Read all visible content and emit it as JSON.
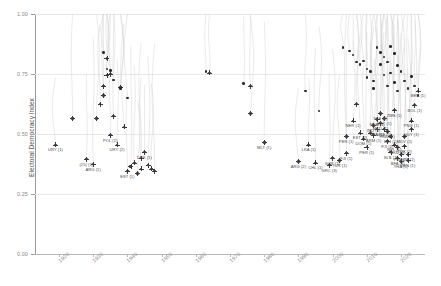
{
  "chart_data": {
    "type": "scatter",
    "title": "",
    "xlabel": "",
    "ylabel": "Electoral Democracy Index",
    "xlim": [
      1913,
      2027
    ],
    "ylim": [
      0.0,
      1.0
    ],
    "grid": true,
    "legend": "none",
    "xticks": [
      1920,
      1930,
      1940,
      1950,
      1960,
      1970,
      1980,
      1990,
      2000,
      2010,
      2020
    ],
    "yticks": [
      "0.00",
      "0.25",
      "0.50",
      "0.75",
      "1.00"
    ],
    "series": [
      {
        "name": "Democratic breakdown episodes",
        "marker": "plus-dot",
        "color": "#2b2b2b",
        "points": [
          {
            "x": 1919,
            "y": 0.455,
            "label": "URY (1)"
          },
          {
            "x": 1924,
            "y": 0.565,
            "label": ""
          },
          {
            "x": 1928,
            "y": 0.395,
            "label": "(25) (1)"
          },
          {
            "x": 1930,
            "y": 0.375,
            "label": "ARG (1)"
          },
          {
            "x": 1931,
            "y": 0.565,
            "label": ""
          },
          {
            "x": 1932,
            "y": 0.625,
            "label": ""
          },
          {
            "x": 1933,
            "y": 0.7,
            "label": ""
          },
          {
            "x": 1933,
            "y": 0.66,
            "label": ""
          },
          {
            "x": 1934,
            "y": 0.815,
            "label": ""
          },
          {
            "x": 1934,
            "y": 0.745,
            "label": ""
          },
          {
            "x": 1935,
            "y": 0.75,
            "label": ""
          },
          {
            "x": 1935,
            "y": 0.495,
            "label": "POL (1)"
          },
          {
            "x": 1936,
            "y": 0.575,
            "label": ""
          },
          {
            "x": 1937,
            "y": 0.455,
            "label": "URY (2)"
          },
          {
            "x": 1938,
            "y": 0.695,
            "label": ""
          },
          {
            "x": 1939,
            "y": 0.53,
            "label": ""
          },
          {
            "x": 1940,
            "y": 0.345,
            "label": "EST (1)"
          },
          {
            "x": 1941,
            "y": 0.365,
            "label": ""
          },
          {
            "x": 1942,
            "y": 0.38,
            "label": ""
          },
          {
            "x": 1943,
            "y": 0.335,
            "label": ""
          },
          {
            "x": 1944,
            "y": 0.4,
            "label": ""
          },
          {
            "x": 1944,
            "y": 0.355,
            "label": ""
          },
          {
            "x": 1945,
            "y": 0.425,
            "label": "DNK (1)"
          },
          {
            "x": 1946,
            "y": 0.37,
            "label": ""
          },
          {
            "x": 1947,
            "y": 0.355,
            "label": ""
          },
          {
            "x": 1948,
            "y": 0.345,
            "label": ""
          },
          {
            "x": 1964,
            "y": 0.755,
            "label": ""
          },
          {
            "x": 1976,
            "y": 0.7,
            "label": ""
          },
          {
            "x": 1980,
            "y": 0.465,
            "label": "MLT (1)"
          },
          {
            "x": 1976,
            "y": 0.585,
            "label": ""
          },
          {
            "x": 1990,
            "y": 0.385,
            "label": "ARG (2)"
          },
          {
            "x": 1995,
            "y": 0.38,
            "label": "CHL (1)"
          },
          {
            "x": 1999,
            "y": 0.37,
            "label": "GRC (3)"
          },
          {
            "x": 1993,
            "y": 0.455,
            "label": "LKA (1)"
          },
          {
            "x": 2000,
            "y": 0.4,
            "label": "SUR (1)"
          },
          {
            "x": 2002,
            "y": 0.39,
            "label": "TUR (1)"
          },
          {
            "x": 2004,
            "y": 0.49,
            "label": "PER (1)"
          },
          {
            "x": 2004,
            "y": 0.42,
            "label": "FJI (1)"
          },
          {
            "x": 2006,
            "y": 0.555,
            "label": "NER (1)"
          },
          {
            "x": 2007,
            "y": 0.625,
            "label": ""
          },
          {
            "x": 2008,
            "y": 0.505,
            "label": "EST (2)"
          },
          {
            "x": 2009,
            "y": 0.48,
            "label": "DOM (1)"
          },
          {
            "x": 2010,
            "y": 0.445,
            "label": "PER (1)"
          },
          {
            "x": 2011,
            "y": 0.505,
            "label": ""
          },
          {
            "x": 2012,
            "y": 0.535,
            "label": "IND (1)"
          },
          {
            "x": 2012,
            "y": 0.495,
            "label": "ARM (1)"
          },
          {
            "x": 2013,
            "y": 0.52,
            "label": "TZA (1)"
          },
          {
            "x": 2013,
            "y": 0.56,
            "label": "MDA (1)"
          },
          {
            "x": 2014,
            "y": 0.545,
            "label": "MKD (1)"
          },
          {
            "x": 2014,
            "y": 0.585,
            "label": "SLE (1)"
          },
          {
            "x": 2015,
            "y": 0.565,
            "label": "GUY (1)"
          },
          {
            "x": 2015,
            "y": 0.52,
            "label": "UKR (1)"
          },
          {
            "x": 2016,
            "y": 0.47,
            "label": "FJI (2)"
          },
          {
            "x": 2016,
            "y": 0.51,
            "label": "HND (1)"
          },
          {
            "x": 2017,
            "y": 0.425,
            "label": "SLB (1)"
          },
          {
            "x": 2017,
            "y": 0.49,
            "label": "MLI (1)"
          },
          {
            "x": 2018,
            "y": 0.455,
            "label": "NPL (1)"
          },
          {
            "x": 2018,
            "y": 0.6,
            "label": "ZMB (1)"
          },
          {
            "x": 2019,
            "y": 0.445,
            "label": "MKD (2)"
          },
          {
            "x": 2019,
            "y": 0.4,
            "label": "BFA (1)"
          },
          {
            "x": 2020,
            "y": 0.385,
            "label": "THA (1)"
          },
          {
            "x": 2020,
            "y": 0.415,
            "label": "PSE (1)"
          },
          {
            "x": 2021,
            "y": 0.49,
            "label": "MDV (2)"
          },
          {
            "x": 2021,
            "y": 0.45,
            "label": "TUR (2)"
          },
          {
            "x": 2022,
            "y": 0.415,
            "label": "NIC (1)"
          },
          {
            "x": 2022,
            "y": 0.39,
            "label": "VEN (1)"
          },
          {
            "x": 2023,
            "y": 0.52,
            "label": "GUY (1)"
          },
          {
            "x": 2023,
            "y": 0.555,
            "label": "PNG (1)"
          },
          {
            "x": 2024,
            "y": 0.62,
            "label": "BOL (1)"
          },
          {
            "x": 2025,
            "y": 0.68,
            "label": "BEN (1)"
          }
        ],
        "unlabeled_points": [
          {
            "x": 1933,
            "y": 0.84
          },
          {
            "x": 1934,
            "y": 0.77
          },
          {
            "x": 1935,
            "y": 0.765
          },
          {
            "x": 1936,
            "y": 0.725
          },
          {
            "x": 1938,
            "y": 0.69
          },
          {
            "x": 1940,
            "y": 0.65
          },
          {
            "x": 1963,
            "y": 0.76
          },
          {
            "x": 1974,
            "y": 0.71
          },
          {
            "x": 1992,
            "y": 0.68
          },
          {
            "x": 1996,
            "y": 0.595
          },
          {
            "x": 2003,
            "y": 0.86
          },
          {
            "x": 2005,
            "y": 0.845
          },
          {
            "x": 2006,
            "y": 0.83
          },
          {
            "x": 2007,
            "y": 0.8
          },
          {
            "x": 2008,
            "y": 0.79
          },
          {
            "x": 2009,
            "y": 0.805
          },
          {
            "x": 2010,
            "y": 0.77
          },
          {
            "x": 2010,
            "y": 0.735
          },
          {
            "x": 2011,
            "y": 0.76
          },
          {
            "x": 2012,
            "y": 0.72
          },
          {
            "x": 2012,
            "y": 0.69
          },
          {
            "x": 2013,
            "y": 0.86
          },
          {
            "x": 2014,
            "y": 0.84
          },
          {
            "x": 2014,
            "y": 0.79
          },
          {
            "x": 2015,
            "y": 0.82
          },
          {
            "x": 2015,
            "y": 0.745
          },
          {
            "x": 2016,
            "y": 0.8
          },
          {
            "x": 2016,
            "y": 0.7
          },
          {
            "x": 2017,
            "y": 0.865
          },
          {
            "x": 2017,
            "y": 0.755
          },
          {
            "x": 2018,
            "y": 0.835
          },
          {
            "x": 2018,
            "y": 0.715
          },
          {
            "x": 2019,
            "y": 0.785
          },
          {
            "x": 2019,
            "y": 0.68
          },
          {
            "x": 2020,
            "y": 0.76
          },
          {
            "x": 2021,
            "y": 0.72
          },
          {
            "x": 2022,
            "y": 0.69
          },
          {
            "x": 2023,
            "y": 0.74
          },
          {
            "x": 2024,
            "y": 0.7
          },
          {
            "x": 2025,
            "y": 0.66
          }
        ]
      }
    ]
  }
}
